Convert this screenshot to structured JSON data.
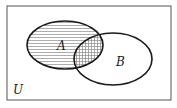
{
  "diagram": {
    "type": "venn",
    "universe_label": "U",
    "sets": [
      {
        "label": "A",
        "shading": "horizontal-hatch"
      },
      {
        "label": "B",
        "shading": "none"
      }
    ],
    "intersection_shading": "cross-hatch",
    "colors": {
      "stroke": "#1a1a1a",
      "hatch": "#888888",
      "background": "#ffffff"
    }
  }
}
